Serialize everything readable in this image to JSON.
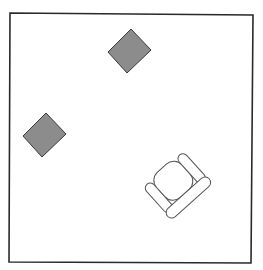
{
  "diagram": {
    "type": "floor-plan",
    "room": {
      "label": "room-outline",
      "stroke": "#2a2a2a",
      "fill": "#ffffff"
    },
    "elements": [
      {
        "kind": "square-tile",
        "label": "gray-square-top",
        "fill": "#8c8c8c",
        "stroke": "#3a3a3a"
      },
      {
        "kind": "square-tile",
        "label": "gray-square-left",
        "fill": "#8c8c8c",
        "stroke": "#3a3a3a"
      },
      {
        "kind": "armchair",
        "label": "armchair",
        "fill": "#ffffff",
        "stroke": "#555555"
      }
    ]
  }
}
